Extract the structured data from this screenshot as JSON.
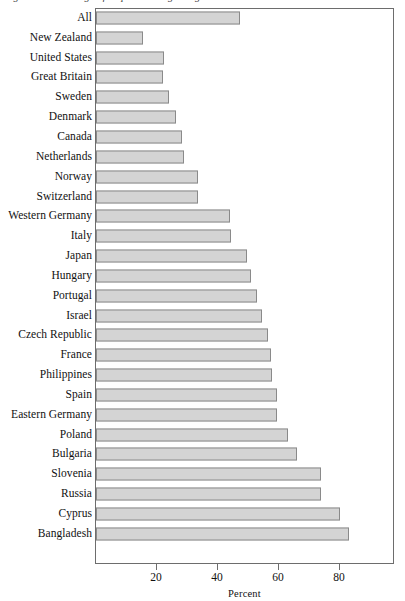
{
  "figure": {
    "caption_cutoff": "Figure 1. Percentage of respondents agreeing",
    "plot_left_px": 95,
    "plot_top_px": 8,
    "plot_width_px": 299,
    "plot_height_px": 556
  },
  "axis": {
    "x_title": "Percent",
    "ticks": [
      {
        "label": "20",
        "value": 20
      },
      {
        "label": "40",
        "value": 40
      },
      {
        "label": "60",
        "value": 60
      },
      {
        "label": "80",
        "value": 80
      }
    ]
  },
  "colors": {
    "bar_fill": "#d4d4d4",
    "bar_stroke": "#8a8a8a",
    "frame": "#6d6d6d",
    "text": "#111111",
    "background": "#ffffff"
  },
  "chart_data": {
    "type": "bar",
    "orientation": "horizontal",
    "title": "",
    "subtitle": "",
    "xlabel": "Percent",
    "ylabel": "",
    "xlim": [
      0,
      98
    ],
    "ylim": null,
    "grid": false,
    "legend": null,
    "legend_position": "none",
    "categories": [
      "All",
      "New Zealand",
      "United States",
      "Great Britain",
      "Sweden",
      "Denmark",
      "Canada",
      "Netherlands",
      "Norway",
      "Switzerland",
      "Western Germany",
      "Italy",
      "Japan",
      "Hungary",
      "Portugal",
      "Israel",
      "Czech Republic",
      "France",
      "Philippines",
      "Spain",
      "Eastern Germany",
      "Poland",
      "Bulgaria",
      "Slovenia",
      "Russia",
      "Cyprus",
      "Bangladesh"
    ],
    "values": [
      47,
      15,
      22,
      21.5,
      23.5,
      26,
      28,
      28.5,
      33,
      33,
      43.5,
      44,
      49,
      50.5,
      52.5,
      54,
      56,
      57,
      57.5,
      59,
      59,
      62.5,
      65.5,
      73.5,
      73.5,
      79.5,
      82.5
    ],
    "tick_labels_x": [
      "20",
      "40",
      "60",
      "80"
    ]
  }
}
